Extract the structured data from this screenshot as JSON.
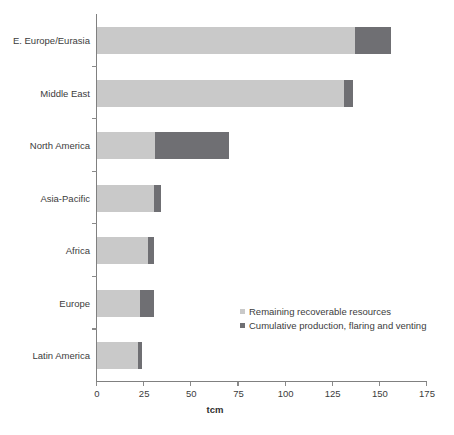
{
  "chart_data": {
    "type": "bar",
    "orientation": "horizontal",
    "stacked": true,
    "title": "",
    "xlabel": "tcm",
    "ylabel": "",
    "xlim": [
      0,
      175
    ],
    "xticks": [
      0,
      25,
      50,
      75,
      100,
      125,
      150,
      175
    ],
    "xtick_labels": [
      "0",
      "25",
      "50",
      "75",
      "100",
      "125",
      "150",
      "175"
    ],
    "grid": false,
    "legend_position": "inside-lower-right",
    "categories": [
      "E. Europe/Eurasia",
      "Middle East",
      "North America",
      "Asia-Pacific",
      "Africa",
      "Europe",
      "Latin America"
    ],
    "series": [
      {
        "name": "Remaining recoverable resources",
        "color": "#c9c9c9",
        "values": [
          137,
          131,
          31,
          30,
          27,
          23,
          22
        ]
      },
      {
        "name": "Cumulative production, flaring and venting",
        "color": "#6f6f73",
        "values": [
          19,
          5,
          39,
          4,
          3,
          7,
          2
        ]
      }
    ],
    "totals": [
      156,
      136,
      70,
      34,
      30,
      30,
      24
    ]
  },
  "axis": {
    "x_title": "tcm"
  },
  "legend": {
    "items": [
      {
        "label": "Remaining recoverable resources",
        "color": "#c9c9c9"
      },
      {
        "label": "Cumulative production, flaring and venting",
        "color": "#6f6f73"
      }
    ]
  }
}
